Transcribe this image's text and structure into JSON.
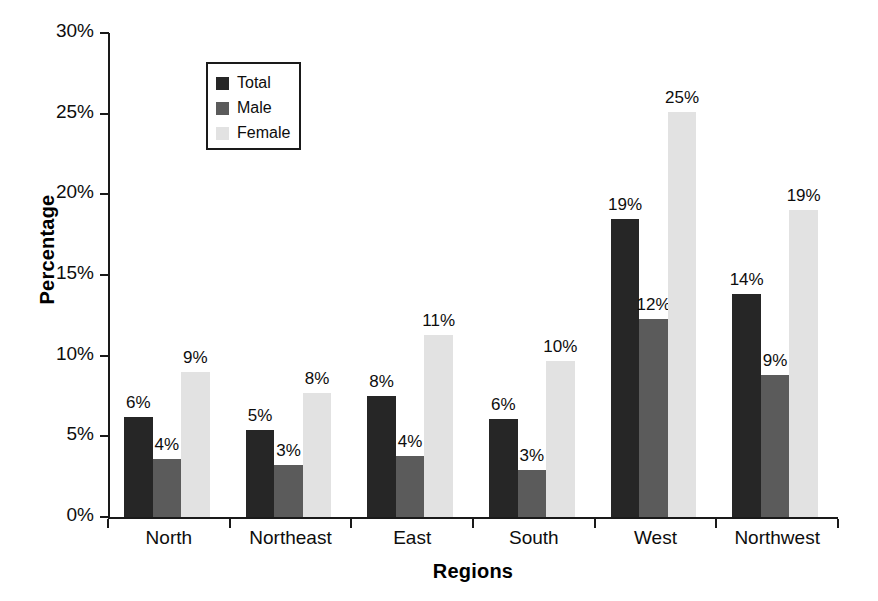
{
  "chart_data": {
    "type": "bar",
    "title": "",
    "subtitle": "",
    "xlabel": "Regions",
    "ylabel": "Percentage",
    "categories": [
      "North",
      "Northeast",
      "East",
      "South",
      "West",
      "Northwest"
    ],
    "series": [
      {
        "name": "Total",
        "color": "#262626",
        "values": [
          6.2,
          5.4,
          7.5,
          6.1,
          18.5,
          13.8
        ],
        "labels": [
          "6%",
          "5%",
          "8%",
          "6%",
          "19%",
          "14%"
        ]
      },
      {
        "name": "Male",
        "color": "#5b5b5b",
        "values": [
          3.6,
          3.2,
          3.8,
          2.9,
          12.3,
          8.8
        ],
        "labels": [
          "4%",
          "3%",
          "4%",
          "3%",
          "12%",
          "9%"
        ]
      },
      {
        "name": "Female",
        "color": "#e2e2e2",
        "values": [
          9.0,
          7.7,
          11.3,
          9.7,
          25.1,
          19.0
        ],
        "labels": [
          "9%",
          "8%",
          "11%",
          "10%",
          "25%",
          "19%"
        ]
      }
    ],
    "ylim": [
      0,
      30
    ],
    "yticks": [
      0,
      5,
      10,
      15,
      20,
      25,
      30
    ],
    "ytick_labels": [
      "0%",
      "5%",
      "10%",
      "15%",
      "20%",
      "25%",
      "30%"
    ],
    "grid": false,
    "legend_position": "upper-left-inside",
    "value_labels_shown": true
  },
  "axes": {
    "y_title": "Percentage",
    "x_title": "Regions",
    "y_tick_labels": [
      "30%",
      "25%",
      "20%",
      "15%",
      "10%",
      "5%",
      "0%"
    ]
  },
  "legend": {
    "entries": [
      {
        "label": "Total"
      },
      {
        "label": "Male"
      },
      {
        "label": "Female"
      }
    ]
  },
  "categories": [
    "North",
    "Northeast",
    "East",
    "South",
    "West",
    "Northwest"
  ]
}
